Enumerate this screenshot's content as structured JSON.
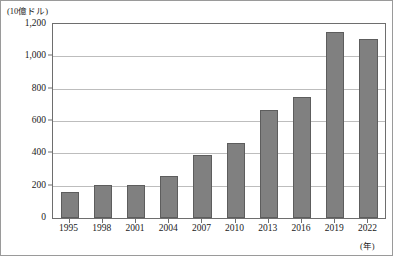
{
  "chart_data": {
    "type": "bar",
    "title": "",
    "subtitle": "",
    "unit_caption": "(10億ドル)",
    "xlabel": "(年)",
    "ylabel": "",
    "categories": [
      "1995",
      "1998",
      "2001",
      "2004",
      "2007",
      "2010",
      "2013",
      "2016",
      "2019",
      "2022"
    ],
    "values": [
      160,
      205,
      205,
      260,
      390,
      465,
      670,
      750,
      1150,
      1110
    ],
    "series": [
      {
        "name": "",
        "values": [
          160,
          205,
          205,
          260,
          390,
          465,
          670,
          750,
          1150,
          1110
        ]
      }
    ],
    "ylim": [
      0,
      1200
    ],
    "ytick_values": [
      0,
      200,
      400,
      600,
      800,
      1000,
      1200
    ],
    "ytick_labels": [
      "0",
      "200",
      "400",
      "600",
      "800",
      "1,000",
      "1,200"
    ],
    "grid": "horizontal",
    "legend": "none",
    "bar_color": "#808080",
    "bar_edge_color": "#5d5d5d",
    "gridline_color": "#bdbdbd",
    "axis_color": "#6e6e6e",
    "text_color": "#1a1a1a",
    "background_color": "#ffffff",
    "frame_color": "#9a9a9a"
  }
}
